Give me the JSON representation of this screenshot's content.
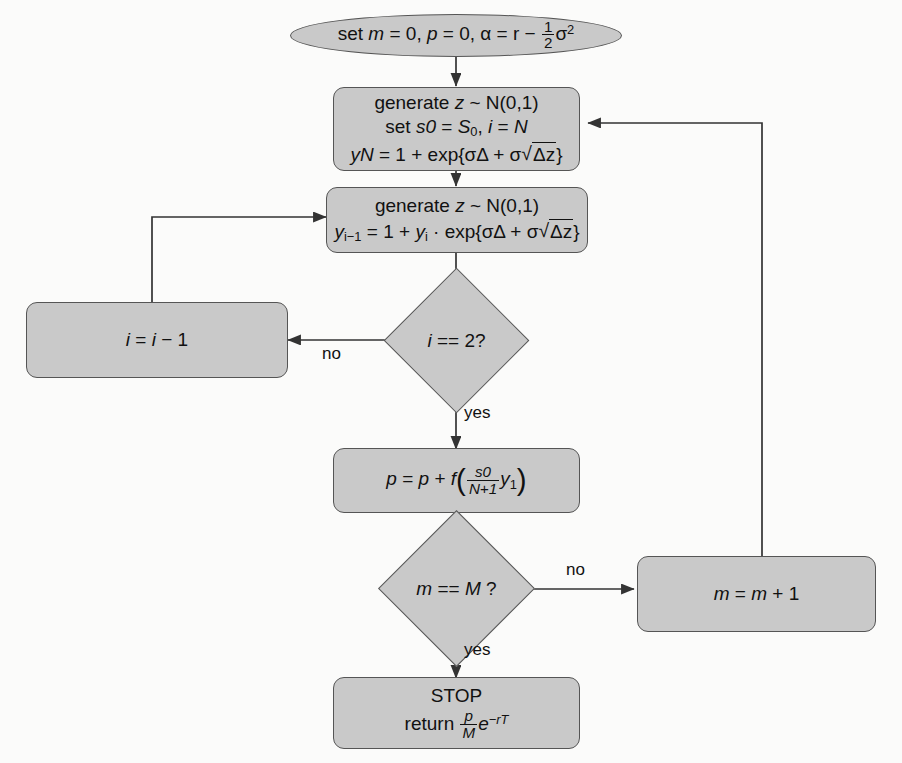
{
  "diagram": {
    "style": {
      "node_fill": "#c9c9c9",
      "node_stroke": "#555555",
      "background": "#fbfbfa",
      "text": "#111111"
    },
    "nodes": [
      {
        "id": "start",
        "type": "terminal",
        "name": "start-node",
        "text_plain": "set m = 0, p = 0, α = r − ½σ²",
        "lines": [
          "set m = 0, p = 0, α = r − 1/2 σ^2"
        ]
      },
      {
        "id": "init",
        "type": "process",
        "name": "initialize-path-node",
        "text_plain": "generate z ~ N(0,1) / set s0 = S0, i = N / yN = 1 + exp{σΔ + σ√Δz}",
        "lines": [
          "generate z ~ N(0,1)",
          "set s0 = S0, i = N",
          "yN = 1 + exp{σΔ + σ√Δz}"
        ]
      },
      {
        "id": "step",
        "type": "process",
        "name": "recursion-step-node",
        "text_plain": "generate z ~ N(0,1) / y(i-1) = 1 + yi · exp{σΔ + σ√Δz}",
        "lines": [
          "generate z ~ N(0,1)",
          "y(i−1) = 1 + y(i) · exp{σΔ + σ√Δz}"
        ]
      },
      {
        "id": "dec_i",
        "type": "decision",
        "name": "i-equals-two-decision",
        "text_plain": "i == 2?"
      },
      {
        "id": "dec_i_label",
        "type": "label",
        "name": "decrement-i-node",
        "text_plain": "i = i − 1"
      },
      {
        "id": "payoff",
        "type": "process",
        "name": "accumulate-payoff-node",
        "text_plain": "p = p + f( s0/(N+1) y1 )"
      },
      {
        "id": "dec_m",
        "type": "decision",
        "name": "m-equals-M-decision",
        "text_plain": "m == M ?"
      },
      {
        "id": "incr_m",
        "type": "process",
        "name": "increment-m-node",
        "text_plain": "m = m + 1"
      },
      {
        "id": "stop",
        "type": "process",
        "name": "stop-node",
        "text_plain": "STOP / return (p/M) e^(−rT)",
        "lines": [
          "STOP",
          "return p/M e^{−rT}"
        ]
      }
    ],
    "edge_labels": {
      "no_i": "no",
      "yes_i": "yes",
      "no_m": "no",
      "yes_m": "yes"
    },
    "text": {
      "start_set": "set",
      "start_m": "m",
      "start_eq0a": " = 0, ",
      "start_p": "p",
      "start_eq0b": " = 0, ",
      "start_alpha": "α",
      "start_eq_r": " = r − ",
      "frac_half_num": "1",
      "frac_half_den": "2",
      "sigma_sq": "σ",
      "sq_exp": "2",
      "generate_z": "generate ",
      "z": "z",
      "tilde_n01": " ~ N(0,1)",
      "set_word": "set ",
      "s0": "s0",
      "eq_space": " = ",
      "S": "S",
      "S_sub": "0",
      "comma_i": ", ",
      "i": "i",
      "eq2": " = ",
      "N": "N",
      "yN": "yN",
      "eq3": " = 1 + exp{",
      "sigma_delta": "σΔ + σ",
      "delta_z": "Δz",
      "close_brace": "}",
      "y": "y",
      "sub_i_minus_1": "i−1",
      "eq4": " = 1 + ",
      "sub_i": "i",
      "dot_exp": " · exp{",
      "i_eq_eq_2": "i",
      "eq_eq_2": " == 2?",
      "i_decr_lhs": "i",
      "i_decr_mid": " = ",
      "i_decr_rhs": "i",
      "i_decr_end": " − 1",
      "p_lhs": "p",
      "p_eq": " = ",
      "p_rhs": "p",
      "p_plus_f": " + ",
      "f": "f",
      "paren_open": "(",
      "frac_s0": "s0",
      "frac_np1": "N+1",
      "y1": "y",
      "y1_sub": "1",
      "paren_close": ")",
      "m_dec": "m",
      "m_dec_eq": " == ",
      "M_dec": "M",
      "M_q": " ?",
      "m_lhs": "m",
      "m_eq": " = ",
      "m_rhs": "m",
      "m_plus1": " + 1",
      "stop_word": "STOP",
      "return_word": "return ",
      "frac_p": "p",
      "frac_M": "M",
      "e_letter": "e",
      "e_exp": "−rT"
    }
  }
}
